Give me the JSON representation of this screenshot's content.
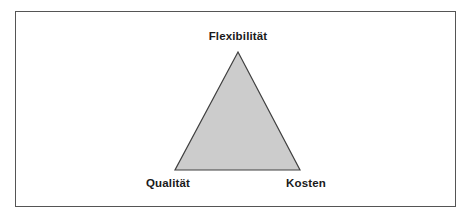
{
  "figure": {
    "frame": {
      "border_color": "#555555"
    },
    "triangle": {
      "fill_color": "#cccccc",
      "stroke_color": "#404040",
      "vertices": {
        "top": {
          "label": "Flexibilität",
          "x": 238,
          "y": 52
        },
        "bottom_left": {
          "label": "Qualität",
          "x": 175,
          "y": 170
        },
        "bottom_right": {
          "label": "Kosten",
          "x": 300,
          "y": 170
        }
      }
    }
  },
  "chart_data": {
    "type": "diagram",
    "shape": "triangle",
    "title": "",
    "categories": [
      "Flexibilität",
      "Qualität",
      "Kosten"
    ],
    "points": [
      {
        "label": "Flexibilität",
        "position": "top",
        "x": 238,
        "y": 52
      },
      {
        "label": "Qualität",
        "position": "bottom-left",
        "x": 175,
        "y": 170
      },
      {
        "label": "Kosten",
        "position": "bottom-right",
        "x": 300,
        "y": 170
      }
    ],
    "fill": "#cccccc",
    "stroke": "#404040",
    "legend": "none",
    "grid": false
  }
}
